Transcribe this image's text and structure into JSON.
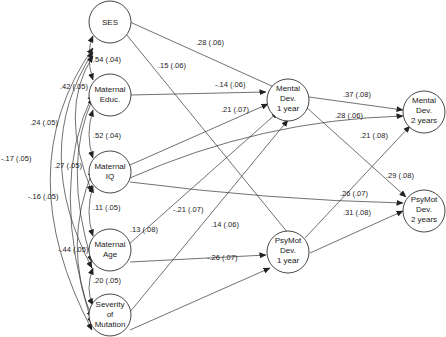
{
  "nodes": {
    "ses": {
      "lines": [
        "SES"
      ]
    },
    "educ": {
      "lines": [
        "Maternal",
        "Educ."
      ]
    },
    "iq": {
      "lines": [
        "Maternal",
        "IQ"
      ]
    },
    "age": {
      "lines": [
        "Maternal",
        "Age"
      ]
    },
    "sev": {
      "lines": [
        "Severity",
        "of",
        "Mutation"
      ]
    },
    "md1": {
      "lines": [
        "Mental",
        "Dev.",
        "1 year"
      ]
    },
    "pd1": {
      "lines": [
        "PsyMot",
        "Dev.",
        "1 year"
      ]
    },
    "md2": {
      "lines": [
        "Mental",
        "Dev.",
        "2 years"
      ]
    },
    "pd2": {
      "lines": [
        "PsyMot",
        "Dev.",
        "2 years"
      ]
    }
  },
  "correlations": {
    "ses_educ": ".54 (.04)",
    "ses_iq": ".42 (.05)",
    "ses_age": ".24 (.05)",
    "ses_sev": "-.17 (.05)",
    "educ_iq": ".52 (.04)",
    "educ_age": ".27 (.05)",
    "educ_sev": "-.16 (.05)",
    "iq_age": ".11 (.05)",
    "iq_sev": "-.44 (.05)",
    "age_sev": ".20 (.05)"
  },
  "paths": {
    "ses_md1": ".28 (.06)",
    "ses_pd1": ".15 (.06)",
    "educ_md1": "-.14 (.06)",
    "iq_md1": ".21 (.07)",
    "age_md1": ".13 (.08)",
    "sev_md1": "-.21 (.07)",
    "age_pd1": ".14 (.06)",
    "sev_pd1": "-.26 (.07)",
    "md1_md2": ".37 (.08)",
    "iq_md2": ".28 (.06)",
    "pd1_md2": ".21 (.08)",
    "md1_pd2": ".29 (.08)",
    "iq_pd2": ".26 (.07)",
    "pd1_pd2": ".31 (.08)"
  }
}
